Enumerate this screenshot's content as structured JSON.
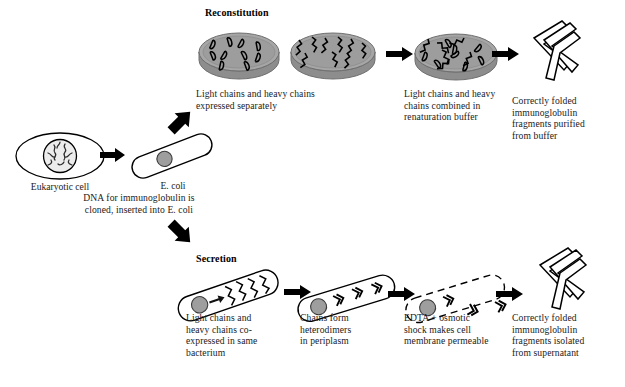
{
  "figure": {
    "branches": {
      "reconstitution": "Reconstitution",
      "secretion": "Secretion"
    }
  },
  "colors": {
    "ink": "#1a1a1a",
    "outline": "#000000",
    "dish_fill": "#a0a0a0",
    "dish_rim": "#8a8a8a",
    "dish_top": "#9a9a9a",
    "plasmid_fill": "#9e9e9e",
    "nucleus_fill": "#d9d9d9",
    "paper": "#ffffff"
  },
  "start": {
    "eukaryotic_cell": {
      "label": "Eukaryotic cell",
      "icon": "eukaryotic-cell-icon"
    },
    "ecoli": {
      "label": "E. coli",
      "icon": "ecoli-cell-icon"
    },
    "process_note": "DNA for immunoglobulin is\ncloned, inserted into E. coli",
    "arrow": "arrow-right-icon",
    "branch_up_arrow": "arrow-up-right-icon",
    "branch_down_arrow": "arrow-down-right-icon"
  },
  "reconstitution": {
    "heading": "Reconstitution",
    "steps": [
      {
        "id": "separate-expression",
        "icon": "petri-dish-pair-icon",
        "caption": "Light chains and heavy chains\nexpressed separately",
        "dishes": [
          {
            "contents": "light-chains",
            "count": 10
          },
          {
            "contents": "heavy-chains",
            "count": 9
          }
        ]
      },
      {
        "id": "renaturation",
        "icon": "petri-dish-icon",
        "caption": "Light chains and heavy\nchains combined in\nrenaturation buffer",
        "dishes": [
          {
            "contents": "mixed-chains",
            "count": 14
          }
        ]
      },
      {
        "id": "purified-fragments",
        "icon": "fab-fragment-icon",
        "caption": "Correctly folded\nimmunoglobulin\nfragments purified\nfrom buffer"
      }
    ],
    "arrows": [
      "arrow-right-icon",
      "arrow-right-icon"
    ]
  },
  "secretion": {
    "heading": "Secretion",
    "steps": [
      {
        "id": "co-expression",
        "icon": "ecoli-coexpression-icon",
        "caption": "Light chains and\nheavy chains co-\nexpressed in same\nbacterium"
      },
      {
        "id": "heterodimers",
        "icon": "ecoli-heterodimer-icon",
        "caption": "Chains form\nheterodimers\nin periplasm"
      },
      {
        "id": "permeabilized",
        "icon": "ecoli-permeabilized-icon",
        "caption": "EDTA + osmotic\nshock makes cell\nmembrane permeable"
      },
      {
        "id": "isolated-fragments",
        "icon": "fab-fragment-icon",
        "caption": "Correctly folded\nimmunoglobulin\nfragments isolated\nfrom supernatant"
      }
    ],
    "arrows": [
      "arrow-right-icon",
      "arrow-right-icon",
      "arrow-right-icon"
    ]
  }
}
